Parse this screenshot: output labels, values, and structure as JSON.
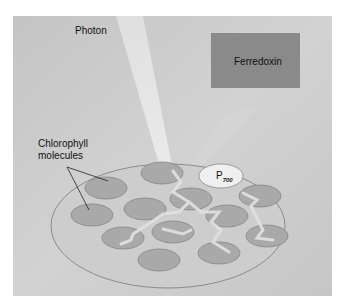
{
  "diagram": {
    "labels": {
      "photon": "Photon",
      "ferredoxin": "Ferredoxin",
      "chlorophyll_line1": "Chlorophyll",
      "chlorophyll_line2": "molecules",
      "p700_main": "P",
      "p700_sub": "700"
    },
    "colors": {
      "background": "#c9c9c9",
      "ferredoxin_box": "#8a8a8a",
      "chlorophyll": "#a9a9a9",
      "p700": "#efefef",
      "beam": "#e4e4e4"
    }
  }
}
